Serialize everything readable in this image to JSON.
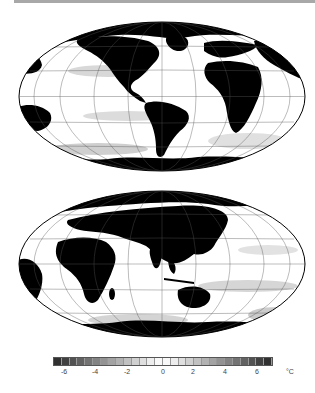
{
  "figure": {
    "panels": [
      {
        "id": "map-top",
        "description": "Global SST difference map, Mollweide projection centered on Americas/Atlantic"
      },
      {
        "id": "map-bottom",
        "description": "Global SST difference map, Mollweide projection centered on Africa/Asia/Indian Ocean"
      }
    ],
    "colorbar": {
      "ticks": [
        "-6",
        "-4",
        "-2",
        "0",
        "2",
        "4",
        "6"
      ],
      "unit": "°C",
      "segments": 28,
      "range": [
        -7,
        7
      ]
    },
    "caption_partial": " "
  },
  "colors": {
    "land": "#000000",
    "ocean": "#ffffff",
    "grid": "#555555",
    "rule": "#a8a8a8"
  }
}
